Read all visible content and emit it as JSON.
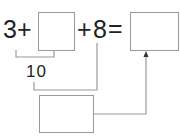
{
  "equation": {
    "first_operand": "3",
    "op1": "+",
    "op2": "+",
    "second_known": "8",
    "equals": "="
  },
  "partial_sum_label": "10",
  "boxes": {
    "missing_addend": "",
    "result": "",
    "intermediate": ""
  },
  "colors": {
    "text": "#222222",
    "lines": "#9a9a9a",
    "arrow": "#333333"
  }
}
